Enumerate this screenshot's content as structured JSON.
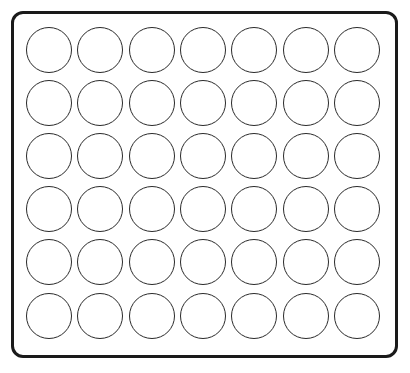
{
  "sheet": {
    "rows": 6,
    "columns": 7,
    "total_circles": 42,
    "frame_color": "#1a1a1a",
    "circle_stroke_color": "#2a2a2a",
    "fill_color": "#ffffff"
  }
}
